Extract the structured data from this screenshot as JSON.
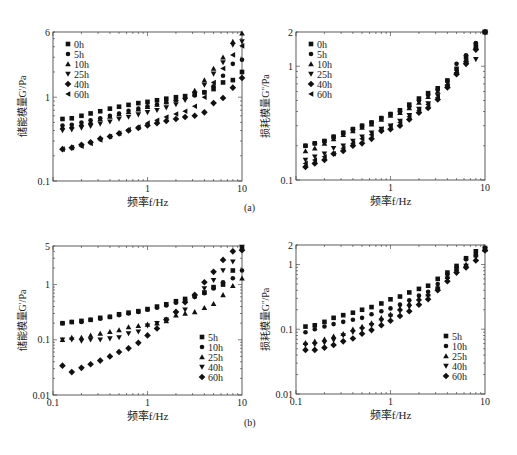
{
  "figure": {
    "panel_a_label": "(a)",
    "panel_b_label": "(b)"
  },
  "chart_data": [
    {
      "id": "a-left",
      "type": "scatter",
      "title": "",
      "xlabel": "频率f/Hz",
      "ylabel": "储能模量G'/Pa",
      "xscale": "log",
      "yscale": "log",
      "xlim": [
        0.1,
        10
      ],
      "ylim": [
        0.1,
        6
      ],
      "xticks": [
        "",
        "1",
        "10"
      ],
      "yticks": [
        "0.1",
        "1",
        "6"
      ],
      "ytick_values": [
        0.1,
        1,
        6
      ],
      "xtick_values": [
        0.1,
        1,
        10
      ],
      "legend_position": "upper-left",
      "grid": false,
      "x": [
        0.126,
        0.158,
        0.2,
        0.25,
        0.316,
        0.4,
        0.5,
        0.63,
        0.8,
        1.0,
        1.26,
        1.58,
        2.0,
        2.5,
        3.16,
        4.0,
        5.0,
        6.3,
        8.0,
        10.0
      ],
      "series": [
        {
          "name": "0h",
          "marker": "square",
          "values": [
            0.55,
            0.56,
            0.6,
            0.64,
            0.68,
            0.73,
            0.77,
            0.81,
            0.85,
            0.88,
            0.92,
            0.96,
            1.0,
            1.03,
            1.08,
            1.14,
            1.25,
            1.5,
            1.6,
            2.0
          ]
        },
        {
          "name": "5h",
          "marker": "circle",
          "values": [
            0.46,
            0.47,
            0.5,
            0.53,
            0.56,
            0.6,
            0.64,
            0.69,
            0.73,
            0.78,
            0.82,
            0.87,
            0.92,
            0.98,
            1.05,
            1.15,
            1.35,
            1.8,
            2.5,
            2.8
          ]
        },
        {
          "name": "10h",
          "marker": "triangle-up",
          "values": [
            0.44,
            0.45,
            0.48,
            0.51,
            0.55,
            0.59,
            0.63,
            0.67,
            0.72,
            0.77,
            0.82,
            0.88,
            0.95,
            1.02,
            1.2,
            1.6,
            2.2,
            3.0,
            4.6,
            5.8
          ]
        },
        {
          "name": "25h",
          "marker": "triangle-down",
          "values": [
            0.4,
            0.41,
            0.43,
            0.45,
            0.48,
            0.51,
            0.55,
            0.58,
            0.62,
            0.66,
            0.7,
            0.75,
            0.82,
            0.92,
            1.1,
            1.4,
            1.9,
            2.6,
            4.2,
            4.6
          ]
        },
        {
          "name": "40h",
          "marker": "diamond",
          "values": [
            0.24,
            0.25,
            0.27,
            0.29,
            0.32,
            0.34,
            0.37,
            0.4,
            0.43,
            0.46,
            0.49,
            0.52,
            0.55,
            0.58,
            0.6,
            0.66,
            0.85,
            0.98,
            1.3,
            1.7
          ]
        },
        {
          "name": "60h",
          "marker": "triangle-left",
          "values": [
            0.24,
            0.25,
            0.26,
            0.28,
            0.31,
            0.34,
            0.37,
            0.41,
            0.44,
            0.49,
            0.53,
            0.58,
            0.63,
            0.68,
            0.78,
            1.0,
            1.5,
            2.2,
            3.2,
            4.1
          ]
        }
      ]
    },
    {
      "id": "a-right",
      "type": "scatter",
      "title": "",
      "xlabel": "频率f/Hz",
      "ylabel": "损耗模量G''/Pa",
      "xscale": "log",
      "yscale": "log",
      "xlim": [
        0.1,
        10
      ],
      "ylim": [
        0.1,
        2
      ],
      "xticks": [
        "",
        "1",
        "10"
      ],
      "yticks": [
        "0.1",
        "1",
        "2"
      ],
      "ytick_values": [
        0.1,
        1,
        2
      ],
      "xtick_values": [
        0.1,
        1,
        10
      ],
      "legend_position": "upper-left",
      "grid": false,
      "x": [
        0.126,
        0.158,
        0.2,
        0.25,
        0.316,
        0.4,
        0.5,
        0.63,
        0.8,
        1.0,
        1.26,
        1.58,
        2.0,
        2.5,
        3.16,
        4.0,
        5.0,
        6.3,
        8.0,
        10.0
      ],
      "series": [
        {
          "name": "0h",
          "marker": "square",
          "values": [
            0.2,
            0.21,
            0.22,
            0.24,
            0.26,
            0.28,
            0.3,
            0.32,
            0.35,
            0.38,
            0.41,
            0.46,
            0.52,
            0.58,
            0.64,
            0.75,
            0.95,
            1.2,
            1.55,
            2.0
          ]
        },
        {
          "name": "5h",
          "marker": "circle",
          "values": [
            0.2,
            0.21,
            0.22,
            0.24,
            0.26,
            0.28,
            0.3,
            0.32,
            0.35,
            0.38,
            0.4,
            0.44,
            0.5,
            0.56,
            0.62,
            0.74,
            1.05,
            1.25,
            1.6,
            2.0
          ]
        },
        {
          "name": "10h",
          "marker": "triangle-up",
          "values": [
            0.18,
            0.19,
            0.21,
            0.23,
            0.25,
            0.27,
            0.29,
            0.31,
            0.34,
            0.37,
            0.39,
            0.43,
            0.48,
            0.54,
            0.6,
            0.7,
            0.9,
            1.15,
            1.5,
            2.0
          ]
        },
        {
          "name": "25h",
          "marker": "triangle-down",
          "values": [
            0.15,
            0.16,
            0.17,
            0.19,
            0.2,
            0.22,
            0.24,
            0.26,
            0.28,
            0.3,
            0.33,
            0.37,
            0.42,
            0.47,
            0.55,
            0.66,
            0.85,
            1.05,
            1.15,
            2.0
          ]
        },
        {
          "name": "40h",
          "marker": "diamond",
          "values": [
            0.13,
            0.14,
            0.15,
            0.17,
            0.18,
            0.2,
            0.21,
            0.23,
            0.27,
            0.28,
            0.3,
            0.34,
            0.39,
            0.43,
            0.51,
            0.65,
            0.85,
            1.05,
            1.4,
            2.0
          ]
        },
        {
          "name": "60h",
          "marker": "triangle-left",
          "values": [
            0.14,
            0.15,
            0.16,
            0.17,
            0.19,
            0.21,
            0.23,
            0.25,
            0.28,
            0.3,
            0.32,
            0.36,
            0.41,
            0.46,
            0.53,
            0.68,
            0.88,
            1.1,
            1.45,
            2.0
          ]
        }
      ]
    },
    {
      "id": "b-left",
      "type": "scatter",
      "title": "",
      "xlabel": "频率f/Hz",
      "ylabel": "储能模量G'/Pa",
      "xscale": "log",
      "yscale": "log",
      "xlim": [
        0.1,
        10
      ],
      "ylim": [
        0.01,
        5
      ],
      "xticks": [
        "0.1",
        "1",
        "10"
      ],
      "yticks": [
        "0.01",
        "0.1",
        "1",
        "5"
      ],
      "ytick_values": [
        0.01,
        0.1,
        1,
        5
      ],
      "xtick_values": [
        0.1,
        1,
        10
      ],
      "legend_position": "lower-right",
      "grid": false,
      "x": [
        0.126,
        0.158,
        0.2,
        0.25,
        0.316,
        0.4,
        0.5,
        0.63,
        0.8,
        1.0,
        1.26,
        1.58,
        2.0,
        2.5,
        3.16,
        4.0,
        5.0,
        6.3,
        8.0,
        10.0
      ],
      "series": [
        {
          "name": "5h",
          "marker": "square",
          "values": [
            0.2,
            0.21,
            0.22,
            0.23,
            0.25,
            0.26,
            0.29,
            0.31,
            0.33,
            0.36,
            0.4,
            0.44,
            0.5,
            0.55,
            0.62,
            0.72,
            0.9,
            1.0,
            1.8,
            4.5
          ]
        },
        {
          "name": "10h",
          "marker": "circle",
          "values": [
            0.2,
            0.21,
            0.21,
            0.23,
            0.24,
            0.26,
            0.28,
            0.3,
            0.32,
            0.35,
            0.38,
            0.42,
            0.47,
            0.53,
            0.6,
            0.7,
            0.85,
            1.1,
            1.3,
            1.8
          ]
        },
        {
          "name": "25h",
          "marker": "triangle-up",
          "values": [
            0.1,
            0.11,
            0.11,
            0.12,
            0.13,
            0.14,
            0.15,
            0.17,
            0.18,
            0.19,
            0.2,
            0.22,
            0.28,
            0.3,
            0.32,
            0.38,
            0.45,
            0.65,
            0.95,
            1.3
          ]
        },
        {
          "name": "40h",
          "marker": "triangle-down",
          "values": [
            0.1,
            0.1,
            0.095,
            0.1,
            0.1,
            0.105,
            0.11,
            0.13,
            0.14,
            0.18,
            0.2,
            0.23,
            0.3,
            0.35,
            0.6,
            0.85,
            1.2,
            1.8,
            2.6,
            4.8
          ]
        },
        {
          "name": "60h",
          "marker": "diamond",
          "values": [
            0.034,
            0.026,
            0.031,
            0.036,
            0.042,
            0.05,
            0.06,
            0.07,
            0.088,
            0.12,
            0.16,
            0.23,
            0.32,
            0.48,
            0.65,
            1.1,
            1.7,
            2.8,
            4.0,
            4.2
          ]
        }
      ]
    },
    {
      "id": "b-right",
      "type": "scatter",
      "title": "",
      "xlabel": "频率f/Hz",
      "ylabel": "损耗模量G''/Pa",
      "xscale": "log",
      "yscale": "log",
      "xlim": [
        0.1,
        10
      ],
      "ylim": [
        0.01,
        2
      ],
      "xticks": [
        "0.1",
        "1",
        "10"
      ],
      "yticks": [
        "0.01",
        "0.1",
        "1",
        "2"
      ],
      "ytick_values": [
        0.01,
        0.1,
        1,
        2
      ],
      "xtick_values": [
        0.1,
        1,
        10
      ],
      "legend_position": "lower-right",
      "grid": false,
      "x": [
        0.126,
        0.158,
        0.2,
        0.25,
        0.316,
        0.4,
        0.5,
        0.63,
        0.8,
        1.0,
        1.26,
        1.58,
        2.0,
        2.5,
        3.16,
        4.0,
        5.0,
        6.3,
        8.0,
        10.0
      ],
      "series": [
        {
          "name": "5h",
          "marker": "square",
          "values": [
            0.11,
            0.115,
            0.13,
            0.15,
            0.165,
            0.18,
            0.2,
            0.22,
            0.25,
            0.29,
            0.32,
            0.37,
            0.42,
            0.47,
            0.6,
            0.75,
            0.95,
            1.25,
            1.6,
            1.8
          ]
        },
        {
          "name": "10h",
          "marker": "circle",
          "values": [
            0.09,
            0.1,
            0.11,
            0.12,
            0.13,
            0.14,
            0.15,
            0.17,
            0.19,
            0.21,
            0.24,
            0.28,
            0.33,
            0.38,
            0.5,
            0.7,
            0.9,
            1.2,
            1.45,
            1.8
          ]
        },
        {
          "name": "25h",
          "marker": "triangle-up",
          "values": [
            0.062,
            0.065,
            0.07,
            0.078,
            0.085,
            0.1,
            0.11,
            0.125,
            0.15,
            0.17,
            0.21,
            0.25,
            0.3,
            0.35,
            0.45,
            0.65,
            0.85,
            1.0,
            1.4,
            1.7
          ]
        },
        {
          "name": "40h",
          "marker": "triangle-down",
          "values": [
            0.057,
            0.058,
            0.062,
            0.068,
            0.08,
            0.09,
            0.1,
            0.115,
            0.135,
            0.16,
            0.19,
            0.22,
            0.27,
            0.32,
            0.42,
            0.6,
            0.8,
            0.95,
            1.3,
            1.7
          ]
        },
        {
          "name": "60h",
          "marker": "diamond",
          "values": [
            0.048,
            0.048,
            0.052,
            0.057,
            0.065,
            0.072,
            0.085,
            0.097,
            0.115,
            0.135,
            0.16,
            0.19,
            0.24,
            0.29,
            0.4,
            0.55,
            0.75,
            0.9,
            1.15,
            1.65
          ]
        }
      ]
    }
  ],
  "layout": {
    "panels": [
      {
        "left": 53,
        "right": 242,
        "top": 32,
        "bottom": 181
      },
      {
        "left": 296,
        "right": 485,
        "top": 32,
        "bottom": 180
      },
      {
        "left": 53,
        "right": 242,
        "top": 246,
        "bottom": 395
      },
      {
        "left": 296,
        "right": 485,
        "top": 245,
        "bottom": 394
      }
    ],
    "legends": [
      {
        "x": 68,
        "y": 44,
        "dy": 10
      },
      {
        "x": 311,
        "y": 44,
        "dy": 10
      },
      {
        "x": 202,
        "y": 337,
        "dy": 10
      },
      {
        "x": 446,
        "y": 336,
        "dy": 10
      }
    ],
    "panel_label_positions": {
      "a": [
        248,
        209
      ],
      "b": [
        248,
        424
      ]
    }
  }
}
